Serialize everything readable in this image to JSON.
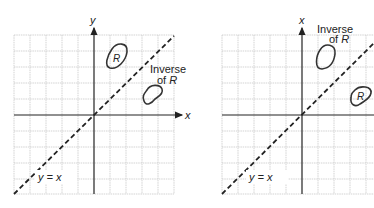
{
  "figures": [
    {
      "id": "left",
      "vertical_axis_label": "y",
      "horizontal_axis_label": "x",
      "line_label": "y = x",
      "region_label": "R",
      "inverse_label_line1": "Inverse",
      "inverse_label_line2_prefix": "of ",
      "inverse_label_line2_var": "R"
    },
    {
      "id": "right",
      "vertical_axis_label": "x",
      "line_label": "y = x",
      "region_label": "R",
      "inverse_label_line1": "Inverse",
      "inverse_label_line2_prefix": "of ",
      "inverse_label_line2_var": "R"
    }
  ],
  "colors": {
    "grid": "#c8c8c8",
    "axis": "#222222",
    "curve": "#333333"
  }
}
